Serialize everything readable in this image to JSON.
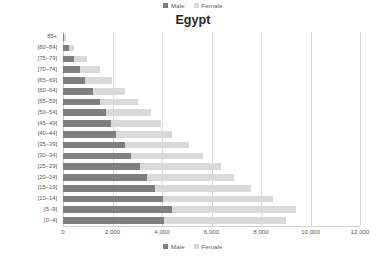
{
  "chart_data": {
    "type": "bar",
    "subtype": "stacked-horizontal-population-pyramid",
    "title": "Egypt",
    "xlabel": "",
    "ylabel": "",
    "xlim": [
      0,
      12000
    ],
    "xticks": [
      0,
      2000,
      4000,
      6000,
      8000,
      10000,
      12000
    ],
    "xtick_labels": [
      "0",
      "2,000",
      "4,000",
      "6,000",
      "8,000",
      "10,000",
      "12,000"
    ],
    "grid": true,
    "legend_position": "top-and-bottom-center",
    "categories": [
      "85+",
      "[80–84]",
      "[75–79]",
      "[70–74]",
      "[65–69]",
      "[60–64]",
      "[55–59]",
      "[50–54]",
      "[45–49]",
      "[40–44]",
      "[35–39]",
      "[30–34]",
      "[25–29]",
      "[20–24]",
      "[15–19]",
      "[10–14]",
      "[5–9]",
      "[0–4]"
    ],
    "series": [
      {
        "name": "Male",
        "color": "#7f7f7f",
        "values": [
          60,
          250,
          430,
          700,
          900,
          1200,
          1500,
          1750,
          1950,
          2150,
          2500,
          2750,
          3100,
          3400,
          3700,
          4050,
          4400,
          4100
        ]
      },
      {
        "name": "Female",
        "color": "#d9d9d9",
        "values": [
          60,
          190,
          520,
          800,
          1100,
          1300,
          1550,
          1800,
          2000,
          2250,
          2600,
          2900,
          3300,
          3500,
          3900,
          4450,
          5000,
          4900
        ]
      }
    ]
  },
  "legend": {
    "male_label": "Male",
    "female_label": "Female",
    "male_color": "#7f7f7f",
    "female_color": "#d9d9d9"
  }
}
